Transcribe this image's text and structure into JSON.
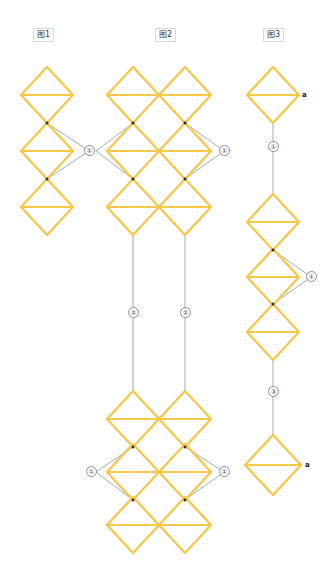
{
  "page": {
    "background": "#ffffff",
    "width": 335,
    "height": 584
  },
  "palette": {
    "diamond_stroke": "#F5C84C",
    "diamond_stroke_light": "#F8D98A",
    "edge_stroke": "#9aa0ad",
    "vertex_dot": "#2b2b2b",
    "badge_border": "#8d8d95",
    "badge_text": "#55555c",
    "label_text": "#3a3a3a",
    "label_border": "#d8d8d8"
  },
  "columns": [
    {
      "id": "figure-1",
      "label": "图1",
      "label_x": 33,
      "label_y": 28
    },
    {
      "id": "figure-2",
      "label": "图2",
      "label_x": 155,
      "label_y": 28
    },
    {
      "id": "figure-3",
      "label": "图3",
      "label_x": 263,
      "label_y": 28
    }
  ],
  "diamonds": [
    {
      "name": "c1-d1",
      "cx": 47,
      "cy": 95,
      "rx": 26,
      "ry": 28
    },
    {
      "name": "c1-d2",
      "cx": 47,
      "cy": 151,
      "rx": 26,
      "ry": 28
    },
    {
      "name": "c1-d3",
      "cx": 47,
      "cy": 207,
      "rx": 26,
      "ry": 28
    },
    {
      "name": "c2a-d1",
      "cx": 133,
      "cy": 95,
      "rx": 26,
      "ry": 28
    },
    {
      "name": "c2a-d2",
      "cx": 133,
      "cy": 151,
      "rx": 26,
      "ry": 28
    },
    {
      "name": "c2a-d3",
      "cx": 133,
      "cy": 207,
      "rx": 26,
      "ry": 28
    },
    {
      "name": "c2a-d4",
      "cx": 133,
      "cy": 419,
      "rx": 26,
      "ry": 28
    },
    {
      "name": "c2a-d5",
      "cx": 133,
      "cy": 472,
      "rx": 26,
      "ry": 28
    },
    {
      "name": "c2a-d6",
      "cx": 133,
      "cy": 525,
      "rx": 26,
      "ry": 28
    },
    {
      "name": "c2b-d1",
      "cx": 185,
      "cy": 95,
      "rx": 26,
      "ry": 28
    },
    {
      "name": "c2b-d2",
      "cx": 185,
      "cy": 151,
      "rx": 26,
      "ry": 28
    },
    {
      "name": "c2b-d3",
      "cx": 185,
      "cy": 207,
      "rx": 26,
      "ry": 28
    },
    {
      "name": "c2b-d4",
      "cx": 185,
      "cy": 419,
      "rx": 26,
      "ry": 28
    },
    {
      "name": "c2b-d5",
      "cx": 185,
      "cy": 472,
      "rx": 26,
      "ry": 28
    },
    {
      "name": "c2b-d6",
      "cx": 185,
      "cy": 525,
      "rx": 26,
      "ry": 28
    },
    {
      "name": "c3-d1",
      "cx": 273,
      "cy": 95,
      "rx": 26,
      "ry": 28
    },
    {
      "name": "c3-d2",
      "cx": 273,
      "cy": 222,
      "rx": 26,
      "ry": 28
    },
    {
      "name": "c3-d3",
      "cx": 273,
      "cy": 277,
      "rx": 26,
      "ry": 28
    },
    {
      "name": "c3-d4",
      "cx": 273,
      "cy": 332,
      "rx": 26,
      "ry": 28
    },
    {
      "name": "c3-d5",
      "cx": 273,
      "cy": 465,
      "rx": 28,
      "ry": 30
    }
  ],
  "connector_lines": [
    {
      "name": "c1-edge-left-upper",
      "x1": 47,
      "y1": 123,
      "x2": 89,
      "y2": 151
    },
    {
      "name": "c1-edge-left-lower",
      "x1": 47,
      "y1": 179,
      "x2": 89,
      "y2": 151
    },
    {
      "name": "c2a-edge-upper",
      "x1": 133,
      "y1": 123,
      "x2": 96,
      "y2": 151
    },
    {
      "name": "c2a-edge-lower",
      "x1": 133,
      "y1": 179,
      "x2": 96,
      "y2": 151
    },
    {
      "name": "c2b-edge-upper",
      "x1": 185,
      "y1": 123,
      "x2": 224,
      "y2": 151
    },
    {
      "name": "c2b-edge-lower",
      "x1": 185,
      "y1": 179,
      "x2": 224,
      "y2": 151
    },
    {
      "name": "c2a-long-line",
      "x1": 133,
      "y1": 235,
      "x2": 133,
      "y2": 391
    },
    {
      "name": "c2b-long-line",
      "x1": 185,
      "y1": 235,
      "x2": 185,
      "y2": 391
    },
    {
      "name": "c2a-edge2-upper",
      "x1": 133,
      "y1": 447,
      "x2": 96,
      "y2": 472
    },
    {
      "name": "c2a-edge2-lower",
      "x1": 133,
      "y1": 500,
      "x2": 96,
      "y2": 472
    },
    {
      "name": "c2b-edge2-upper",
      "x1": 185,
      "y1": 447,
      "x2": 224,
      "y2": 472
    },
    {
      "name": "c2b-edge2-lower",
      "x1": 185,
      "y1": 500,
      "x2": 224,
      "y2": 472
    },
    {
      "name": "c3-line-1",
      "x1": 273,
      "y1": 123,
      "x2": 273,
      "y2": 194
    },
    {
      "name": "c3-edge-upper",
      "x1": 273,
      "y1": 250,
      "x2": 311,
      "y2": 277
    },
    {
      "name": "c3-edge-lower",
      "x1": 273,
      "y1": 304,
      "x2": 311,
      "y2": 277
    },
    {
      "name": "c3-line-2",
      "x1": 273,
      "y1": 360,
      "x2": 273,
      "y2": 435
    }
  ],
  "vertex_dots": [
    {
      "name": "c1-vertex-upper",
      "cx": 47,
      "cy": 123
    },
    {
      "name": "c1-vertex-lower",
      "cx": 47,
      "cy": 179
    },
    {
      "name": "c2a-vertex-upper",
      "cx": 133,
      "cy": 123
    },
    {
      "name": "c2a-vertex-lower",
      "cx": 133,
      "cy": 179
    },
    {
      "name": "c2b-vertex-upper",
      "cx": 185,
      "cy": 123
    },
    {
      "name": "c2b-vertex-lower",
      "cx": 185,
      "cy": 179
    },
    {
      "name": "c2a-vertex2-upper",
      "cx": 133,
      "cy": 447
    },
    {
      "name": "c2a-vertex2-lower",
      "cx": 133,
      "cy": 500
    },
    {
      "name": "c2b-vertex2-upper",
      "cx": 185,
      "cy": 447
    },
    {
      "name": "c2b-vertex2-lower",
      "cx": 185,
      "cy": 500
    },
    {
      "name": "c3-vertex-upper",
      "cx": 273,
      "cy": 250
    },
    {
      "name": "c3-vertex-lower",
      "cx": 273,
      "cy": 304
    }
  ],
  "badges": [
    {
      "name": "badge-c1-1",
      "text": "①",
      "x": 84,
      "y": 145
    },
    {
      "name": "badge-c2b-1",
      "text": "①",
      "x": 219,
      "y": 145
    },
    {
      "name": "badge-c2a-2",
      "text": "②",
      "x": 128,
      "y": 307
    },
    {
      "name": "badge-c2b-2",
      "text": "②",
      "x": 180,
      "y": 307
    },
    {
      "name": "badge-c2a-1b",
      "text": "①",
      "x": 86,
      "y": 466
    },
    {
      "name": "badge-c2b-1b",
      "text": "①",
      "x": 219,
      "y": 466
    },
    {
      "name": "badge-c3-1",
      "text": "①",
      "x": 268,
      "y": 141
    },
    {
      "name": "badge-c3-2",
      "text": "①",
      "x": 306,
      "y": 271
    },
    {
      "name": "badge-c3-3",
      "text": "③",
      "x": 268,
      "y": 386
    }
  ],
  "node_tags": [
    {
      "name": "tag-c3-top",
      "text": "a",
      "x": 302,
      "y": 91
    },
    {
      "name": "tag-c3-bottom",
      "text": "a",
      "x": 305,
      "y": 461
    }
  ]
}
